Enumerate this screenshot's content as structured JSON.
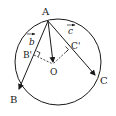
{
  "diagram": {
    "points": {
      "A": {
        "label": "A",
        "x": 48,
        "y": 21
      },
      "B": {
        "label": "B",
        "x": 18,
        "y": 92
      },
      "C": {
        "label": "C",
        "x": 96,
        "y": 77
      },
      "O": {
        "label": "O",
        "x": 53,
        "y": 64
      },
      "B_prime": {
        "label": "B'",
        "x": 32,
        "y": 57
      },
      "C_prime": {
        "label": "C'",
        "x": 70,
        "y": 48
      }
    },
    "circle": {
      "cx": 58,
      "cy": 62,
      "r": 43
    },
    "vectors": {
      "b": {
        "label": "b",
        "from": "A",
        "to": "B"
      },
      "c": {
        "label": "c",
        "from": "A",
        "to": "C"
      },
      "ao": {
        "label": "",
        "from": "A",
        "to": "O"
      }
    },
    "labels": {
      "A": "A",
      "B": "B",
      "C": "C",
      "O": "O",
      "B_prime": "B'",
      "C_prime": "C'",
      "vec_b": "b",
      "vec_c": "c"
    },
    "colors": {
      "stroke": "#1a1a1a",
      "background": "#ffffff"
    }
  }
}
